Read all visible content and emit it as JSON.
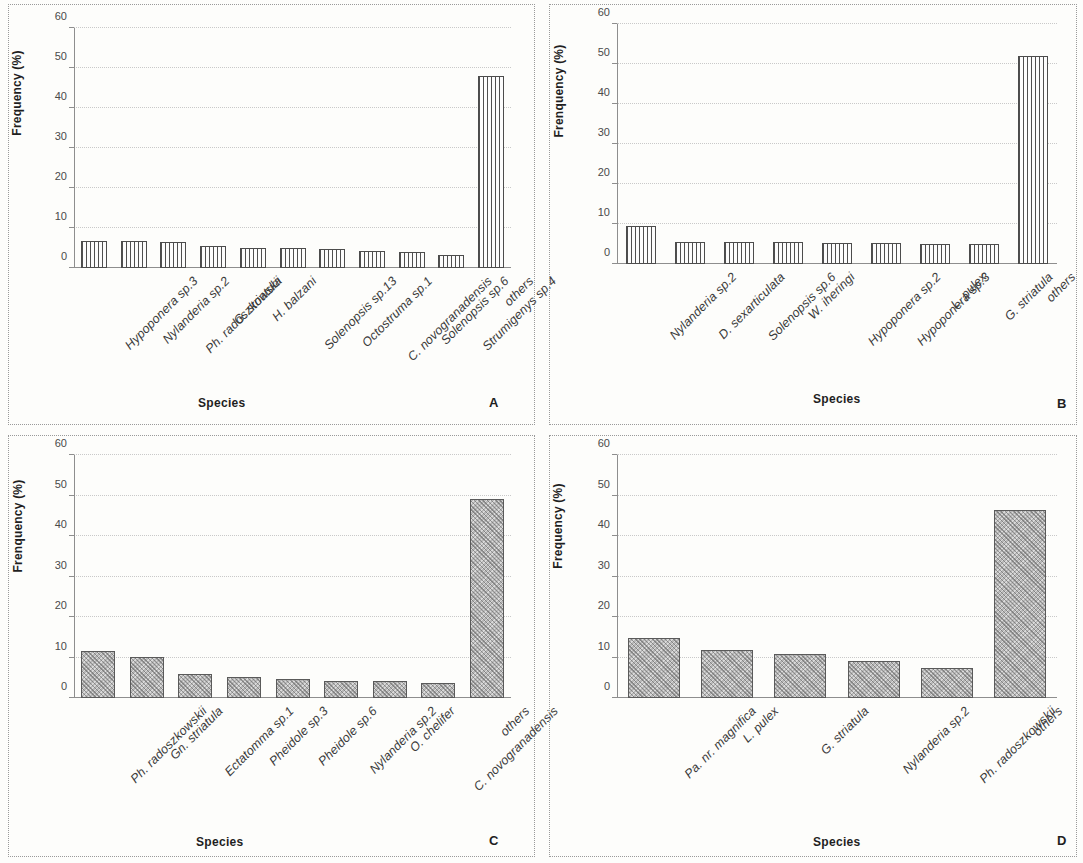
{
  "figure": {
    "panel_letters": [
      "A",
      "B",
      "C",
      "D"
    ]
  },
  "chart_data": [
    {
      "type": "bar",
      "panel": "A",
      "title": "",
      "xlabel": "Species",
      "ylabel": "Frequency (%)",
      "ylim": [
        0,
        60
      ],
      "yticks": [
        0,
        10,
        20,
        30,
        40,
        50,
        60
      ],
      "grid": true,
      "legend": null,
      "bar_style": "vertical-hatch",
      "categories": [
        "Hypoponera sp.3",
        "Nylanderia sp.2",
        "Ph. radoszkowskii",
        "G. striatula",
        "H. balzani",
        "Solenopsis sp.13",
        "Octostruma sp.1",
        "C. novogranadensis",
        "Solenopsis sp.6",
        "Strumigenys sp.4",
        "others"
      ],
      "values": [
        6.8,
        6.8,
        6.5,
        5.5,
        5.1,
        5.1,
        4.7,
        4.2,
        4.0,
        3.3,
        48.0
      ]
    },
    {
      "type": "bar",
      "panel": "B",
      "title": "",
      "xlabel": "Species",
      "ylabel": "Frenquency (%)",
      "ylim": [
        0,
        60
      ],
      "yticks": [
        0,
        10,
        20,
        30,
        40,
        50,
        60
      ],
      "grid": true,
      "legend": null,
      "bar_style": "vertical-hatch",
      "categories": [
        "Nylanderia sp.2",
        "D. sexarticulata",
        "Solenopsis sp.6",
        "W. iheringi",
        "Hypoponera sp.2",
        "Hypoponera sp.3",
        "L. pulex",
        "G. striatula",
        "others"
      ],
      "values": [
        9.4,
        5.5,
        5.5,
        5.6,
        5.2,
        5.2,
        5.1,
        4.9,
        52.0
      ]
    },
    {
      "type": "bar",
      "panel": "C",
      "title": "",
      "xlabel": "Species",
      "ylabel": "Frenquency (%)",
      "ylim": [
        0,
        60
      ],
      "yticks": [
        0,
        10,
        20,
        30,
        40,
        50,
        60
      ],
      "grid": true,
      "legend": null,
      "bar_style": "solid-gray",
      "categories": [
        "Ph. radoszkowskii",
        "Gn. striatula",
        "Ectatomma sp.1",
        "Pheidole sp.3",
        "Pheidole sp.6",
        "Nylanderia sp.2",
        "O. chelifer",
        "C. novogranadensis",
        "others"
      ],
      "values": [
        11.7,
        10.1,
        6.0,
        5.2,
        4.8,
        4.2,
        4.2,
        3.8,
        49.2
      ]
    },
    {
      "type": "bar",
      "panel": "D",
      "title": "",
      "xlabel": "Species",
      "ylabel": "Frequency (%)",
      "ylim": [
        0,
        60
      ],
      "yticks": [
        0,
        10,
        20,
        30,
        40,
        50,
        60
      ],
      "grid": true,
      "legend": null,
      "bar_style": "solid-gray",
      "categories": [
        "Pa. nr. magnifica",
        "L. pulex",
        "G. striatula",
        "Nylanderia sp.2",
        "Ph. radoszkowskii",
        "others"
      ],
      "values": [
        14.8,
        11.9,
        10.9,
        9.1,
        7.4,
        46.4
      ]
    }
  ]
}
